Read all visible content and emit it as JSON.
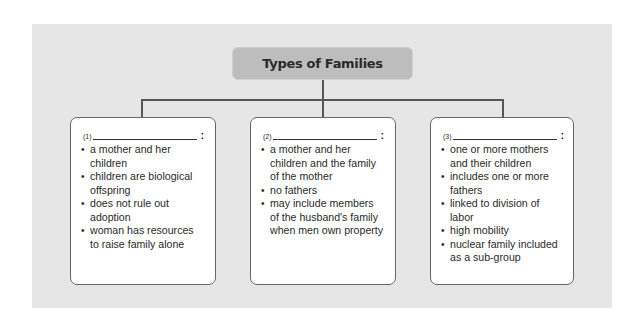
{
  "diagram": {
    "title": "Types of Families",
    "colors": {
      "panel": "#e6e6e6",
      "title_box": "#bdbdbd",
      "card": "#ffffff",
      "line": "#555555"
    },
    "cards": [
      {
        "number": "(1)",
        "blank": "",
        "colon": ":",
        "bullets": [
          "a mother and her children",
          "children are biological offspring",
          "does not rule out adoption",
          "woman has resources to raise family alone"
        ]
      },
      {
        "number": "(2)",
        "blank": "",
        "colon": ":",
        "bullets": [
          "a mother and her children and the family of the mother",
          "no fathers",
          "may include members of the husband's family when men own property"
        ]
      },
      {
        "number": "(3)",
        "blank": "",
        "colon": ":",
        "bullets": [
          "one or more mothers and their children",
          "includes one or more fathers",
          "linked to division of labor",
          "high mobility",
          "nuclear family included as a sub-group"
        ]
      }
    ]
  }
}
